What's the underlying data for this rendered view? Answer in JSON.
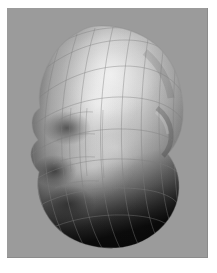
{
  "page": {
    "width": 217,
    "height": 273,
    "background_color": "#ffffff"
  },
  "viewport": {
    "name": "render-viewport",
    "x": 7,
    "y": 8,
    "width": 201,
    "height": 250,
    "background_color": "#9b9b9b"
  },
  "render": {
    "subject": "human head",
    "view": "three-quarter left profile",
    "shading": "smooth gouraud grayscale",
    "overlay": "quad wireframe mesh",
    "highlight_color": "#e9e9e9",
    "midtone_color": "#b4b4b4",
    "shadow_color": "#1c1c1c",
    "wireframe_color": "#8a8a8a",
    "wireframe_opacity": 0.5,
    "silhouette": {
      "top_y": 18,
      "bottom_y": 240,
      "left_x": 22,
      "right_x": 176
    },
    "features": [
      {
        "name": "forehead-highlight",
        "cx": 105,
        "cy": 70
      },
      {
        "name": "nose-profile",
        "cx": 30,
        "cy": 140
      },
      {
        "name": "brow-ridge",
        "cx": 140,
        "cy": 115
      },
      {
        "name": "cheek",
        "cx": 95,
        "cy": 160
      },
      {
        "name": "jaw-shadow",
        "cx": 90,
        "cy": 225
      }
    ]
  },
  "labels": {
    "figure_title": "",
    "caption": ""
  }
}
